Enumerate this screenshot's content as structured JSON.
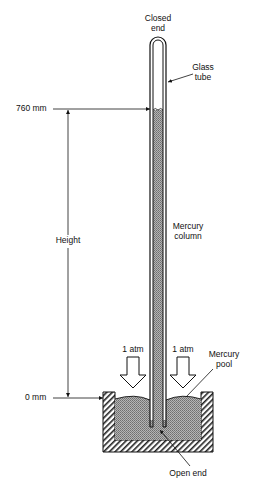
{
  "diagram": {
    "labels": {
      "closed_end": [
        "Closed",
        "end"
      ],
      "glass_tube": [
        "Glass",
        "tube"
      ],
      "top_level": "760 mm",
      "height": "Height",
      "mercury_column": [
        "Mercury",
        "column"
      ],
      "atm_left": "1 atm",
      "atm_right": "1 atm",
      "mercury_pool": [
        "Mercury",
        "pool"
      ],
      "bottom_level": "0 mm",
      "open_end": "Open end"
    },
    "colors": {
      "ink": "#111111",
      "mercury": "#9a9a9a",
      "background": "#ffffff"
    }
  }
}
